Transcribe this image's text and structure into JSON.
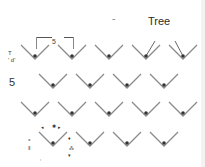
{
  "figure": {
    "title": "Tree",
    "header_mark": "~",
    "dimension_label": "5",
    "row_label": "5",
    "side_annotation": [
      "T",
      "' d'"
    ],
    "stroke_color": "#8a8a8a",
    "dot_color": "#333333"
  },
  "rows": [
    {
      "index": 0,
      "y": 55,
      "x": [
        35,
        72,
        109,
        146,
        183
      ],
      "arrow": [
        false,
        false,
        false,
        true,
        true
      ]
    },
    {
      "index": 1,
      "y": 84,
      "x": [
        53,
        90,
        127,
        164
      ],
      "arrow": [
        false,
        false,
        false,
        false
      ]
    },
    {
      "index": 2,
      "y": 112,
      "x": [
        35,
        72,
        109,
        146,
        183
      ],
      "arrow": [
        false,
        false,
        false,
        false,
        false
      ]
    },
    {
      "index": 3,
      "y": 142,
      "x": [
        53,
        90,
        127,
        164
      ],
      "arrow": [
        false,
        false,
        false,
        false
      ]
    }
  ],
  "scatter_marks": [
    {
      "x": 41,
      "y": 124,
      "t": "◂"
    },
    {
      "x": 52,
      "y": 123,
      "t": "✱"
    },
    {
      "x": 58,
      "y": 124,
      "t": "▸"
    },
    {
      "x": 28,
      "y": 136,
      "t": "⁎"
    },
    {
      "x": 28,
      "y": 146,
      "t": "⁑"
    },
    {
      "x": 68,
      "y": 135,
      "t": "♦"
    },
    {
      "x": 69,
      "y": 145,
      "t": "⁂"
    },
    {
      "x": 68,
      "y": 152,
      "t": "▾"
    },
    {
      "x": 40,
      "y": 155,
      "t": "‚"
    }
  ]
}
